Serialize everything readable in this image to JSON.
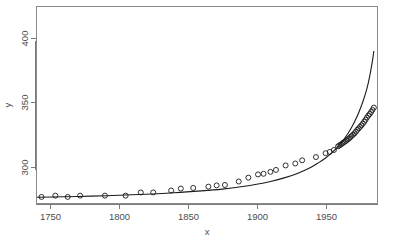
{
  "chart_data": {
    "type": "scatter",
    "title": "",
    "xlabel": "x",
    "ylabel": "y",
    "grid": false,
    "legend": "none",
    "xlim": [
      1740,
      1988
    ],
    "ylim": [
      271,
      425
    ],
    "xticks": [
      1750,
      1800,
      1850,
      1900,
      1950
    ],
    "yticks": [
      300,
      350,
      400
    ],
    "xticklabels": [
      "1750",
      "1800",
      "1850",
      "1900",
      "1950"
    ],
    "yticklabels": [
      "300",
      "350",
      "400"
    ],
    "point_marker": "open-circle",
    "point_color": "#1a1a1a",
    "line_color": "#1a1a1a",
    "series": [
      {
        "name": "observations",
        "type": "scatter",
        "x": [
          1744,
          1754,
          1763,
          1772,
          1790,
          1805,
          1816,
          1825,
          1838,
          1845,
          1854,
          1865,
          1871,
          1877,
          1887,
          1894,
          1901,
          1905,
          1910,
          1914,
          1921,
          1928,
          1933,
          1943,
          1950,
          1953,
          1956,
          1959,
          1960,
          1961,
          1962,
          1963,
          1964,
          1965,
          1966,
          1967,
          1968,
          1969,
          1970,
          1971,
          1972,
          1973,
          1974,
          1975,
          1976,
          1977,
          1978,
          1979,
          1980,
          1981,
          1982,
          1983,
          1984,
          1985
        ],
        "y": [
          276.5,
          277.5,
          276.5,
          277.5,
          277.5,
          277.5,
          280.0,
          280.0,
          281.5,
          283.0,
          283.5,
          284.5,
          285.5,
          285.8,
          288.5,
          291.5,
          294.0,
          294.5,
          296.0,
          297.5,
          301.0,
          302.5,
          305.0,
          307.5,
          310.5,
          311.5,
          313.0,
          315.8,
          316.5,
          317.2,
          318.0,
          318.8,
          319.5,
          320.3,
          321.2,
          322.0,
          323.0,
          324.0,
          325.0,
          326.0,
          327.3,
          328.7,
          329.8,
          331.0,
          332.2,
          333.5,
          335.0,
          336.5,
          338.3,
          339.8,
          341.0,
          342.5,
          344.2,
          346.0
        ]
      },
      {
        "name": "fitted exponential curve",
        "type": "line",
        "x": [
          1740,
          1760,
          1780,
          1800,
          1820,
          1840,
          1860,
          1875,
          1890,
          1900,
          1910,
          1920,
          1930,
          1938,
          1945,
          1950,
          1955,
          1960,
          1964,
          1968,
          1971,
          1974,
          1977,
          1980,
          1982,
          1984,
          1985
        ],
        "y": [
          276.2,
          276.6,
          277.1,
          277.8,
          278.6,
          279.7,
          281.2,
          282.6,
          284.6,
          286.3,
          288.5,
          291.3,
          295.0,
          298.8,
          303.2,
          306.8,
          311.3,
          316.8,
          322.3,
          329.0,
          335.0,
          342.0,
          350.5,
          361.0,
          370.5,
          382.5,
          390.0
        ]
      }
    ]
  },
  "figure": {
    "plot_box": {
      "left": 36,
      "top": 6,
      "right": 378,
      "bottom": 204
    },
    "background": "#ffffff",
    "frame_color": "#8a8a8a"
  }
}
